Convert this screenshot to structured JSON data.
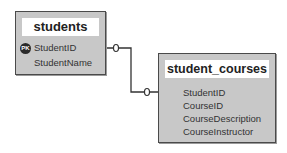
{
  "tables": [
    {
      "name": "students",
      "fields": [
        {
          "label": "StudentID",
          "key": "PK"
        },
        {
          "label": "StudentName"
        }
      ]
    },
    {
      "name": "student_courses",
      "fields": [
        {
          "label": "StudentID"
        },
        {
          "label": "CourseID"
        },
        {
          "label": "CourseDescription"
        },
        {
          "label": "CourseInstructor"
        }
      ]
    }
  ],
  "relationship": {
    "from": "students.StudentID",
    "to": "student_courses.StudentID",
    "from_cardinality": "0",
    "to_cardinality": "0"
  },
  "colors": {
    "table_bg": "#c8c8c8",
    "border": "#4a4a4a",
    "pk_badge": "#2a2a2a"
  }
}
